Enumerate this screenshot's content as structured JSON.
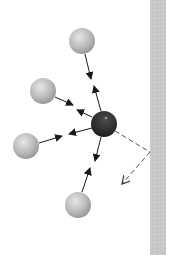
{
  "diagram": {
    "colors": {
      "background": "#ffffff",
      "wall": "#c8c8c8",
      "wall_edge": "#b0b0b0",
      "particle_light": "#bdbdbd",
      "particle_dark": "#2b2b2b",
      "arrow": "#1a1a1a",
      "dashed": "#555555"
    },
    "wall": {
      "x": 150,
      "y": 0,
      "width": 16,
      "height": 255
    },
    "central_particle": {
      "cx": 104,
      "cy": 124,
      "r": 13
    },
    "particles": [
      {
        "id": "top",
        "cx": 82,
        "cy": 41,
        "r": 13
      },
      {
        "id": "upper-left",
        "cx": 43,
        "cy": 91,
        "r": 13
      },
      {
        "id": "left",
        "cx": 26,
        "cy": 146,
        "r": 13
      },
      {
        "id": "bottom",
        "cx": 78,
        "cy": 205,
        "r": 13
      }
    ],
    "reflection": {
      "incoming": {
        "x1": 115,
        "y1": 131,
        "x2": 150,
        "y2": 152
      },
      "outgoing": {
        "x1": 150,
        "y1": 152,
        "x2": 122,
        "y2": 184
      }
    }
  }
}
